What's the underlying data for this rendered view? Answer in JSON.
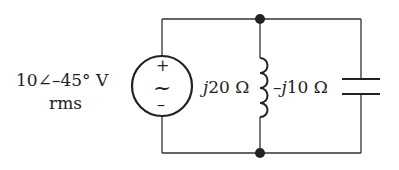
{
  "diagram": {
    "type": "circuit",
    "source": {
      "kind": "AC voltage source",
      "magnitude_label": "10∠–45° V",
      "unit_label": "rms",
      "plus_symbol": "+",
      "minus_symbol": "–",
      "wave_symbol": "~"
    },
    "inductor": {
      "j": "j",
      "label": "20 Ω"
    },
    "capacitor": {
      "prefix": "–",
      "j": "j",
      "label": "10 Ω"
    },
    "colors": {
      "wire": "#333333",
      "text": "#222222"
    }
  }
}
